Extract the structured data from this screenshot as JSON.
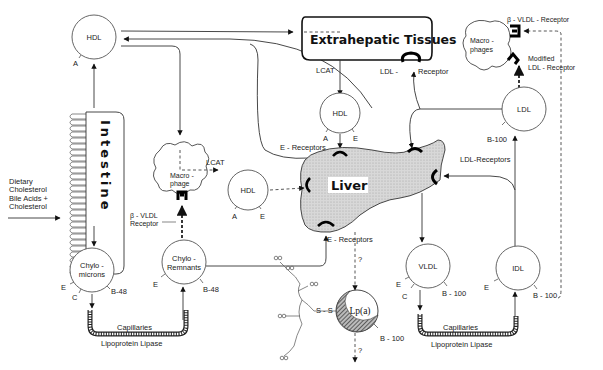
{
  "figure": {
    "nodes": {
      "hdl_top": {
        "label": "HDL",
        "apos": [
          "A"
        ]
      },
      "hdl_center": {
        "label": "HDL",
        "apos": [
          "A",
          "E"
        ]
      },
      "hdl_middle": {
        "label": "HDL",
        "apos": [
          "A",
          "E"
        ]
      },
      "chylomicrons": {
        "label_lines": [
          "Chylo -",
          "microns"
        ],
        "apos": [
          "E",
          "C",
          "B-48"
        ]
      },
      "chylo_remnants": {
        "label_lines": [
          "Chylo -",
          "Remnants"
        ],
        "apos": [
          "E",
          "B-48"
        ]
      },
      "vldl": {
        "label": "VLDL",
        "apos": [
          "E",
          "C",
          "B - 100"
        ]
      },
      "idl": {
        "label": "IDL",
        "apos": [
          "E",
          "B - 100"
        ]
      },
      "ldl": {
        "label": "LDL",
        "apos": [
          "B-100"
        ]
      },
      "lpa": {
        "label": "Lp(a)",
        "apos": [
          "B - 100"
        ]
      }
    },
    "organs": {
      "intestine": "Intestine",
      "liver": "Liver",
      "extrahepatic": "Extrahepatic  Tissues",
      "macrophage": [
        "Macro -",
        "phage"
      ],
      "macrophages": [
        "Macro -",
        "phages"
      ]
    },
    "labels": {
      "dietary": [
        "Dietary",
        "Cholesterol",
        "Bile Acids +",
        "Cholesterol"
      ],
      "lcat_top": "LCAT",
      "lcat_mid": "LCAT",
      "ldl_receptor_prefix": "LDL -",
      "ldl_receptor_suffix": "Receptor",
      "beta_vldl_receptor_left": [
        "β - VLDL",
        "Receptor"
      ],
      "beta_vldl_receptor_right": "β - VLDL  -  Receptor",
      "modified_ldl_receptor": [
        "Modified",
        "LDL - Receptor"
      ],
      "e_receptors_top": "E - Receptors",
      "e_receptors_bottom": "E - Receptors",
      "ldl_receptors": "LDL-Receptors",
      "capillaries_left": "Capillaries",
      "lipase_left": "Lipoprotein  Lipase",
      "capillaries_right": "Capillaries",
      "lipase_right": "Lipoprotein  Lipase",
      "unknown_top": "?",
      "unknown_bottom": "?",
      "ss_bond": "S - S"
    }
  }
}
